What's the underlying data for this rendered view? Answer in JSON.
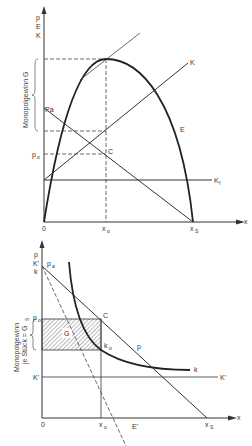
{
  "top_diagram": {
    "y_axis_labels": [
      "p",
      "E",
      "K"
    ],
    "x_axis_label": "x",
    "brace_label": "Monopolgewinn G",
    "labels": {
      "pa": "Pa",
      "p0": "p",
      "p0_sub": "o",
      "C": "C",
      "K": "K",
      "E": "E",
      "Kf": "K",
      "Kf_sub": "f",
      "origin": "0",
      "x0": "x",
      "x0_sub": "o",
      "xs": "x",
      "xs_sub": "S"
    }
  },
  "bottom_diagram": {
    "y_axis_labels": [
      "p",
      "K'",
      "k"
    ],
    "x_axis_label": "x",
    "brace_label_line1": "Monopolgewinn",
    "brace_label_line2": "je Stück = G",
    "brace_label_sub": "S",
    "labels": {
      "pa": "p",
      "pa_sub": "a",
      "p0": "p",
      "p0_sub": "o",
      "C": "C",
      "G": "G",
      "k0": "k",
      "k0_sub": "o",
      "p": "p",
      "k": "k",
      "Kprime_right": "K'",
      "Kprime_left": "K'",
      "Eprime": "E'",
      "origin": "0",
      "x0": "x",
      "x0_sub": "o",
      "xs": "x",
      "xs_sub": "S"
    }
  }
}
